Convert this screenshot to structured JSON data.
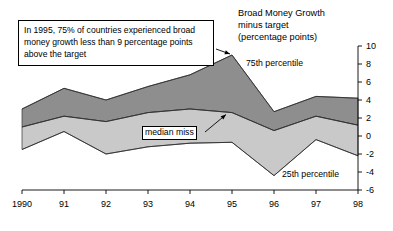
{
  "chart_data": {
    "type": "area",
    "title": "Broad Money Growth\nminus target\n(percentage points)",
    "xlabel": "",
    "ylabel": "",
    "x": [
      1990,
      1991,
      1992,
      1993,
      1994,
      1995,
      1996,
      1997,
      1998
    ],
    "categories": [
      "1990",
      "91",
      "92",
      "93",
      "94",
      "95",
      "96",
      "97",
      "98"
    ],
    "xlim": [
      1990,
      1998
    ],
    "ylim": [
      -6,
      10
    ],
    "ytick_values": [
      10,
      8,
      6,
      4,
      2,
      0,
      -2,
      -4,
      -6
    ],
    "ytick_labels": [
      "10",
      "8",
      "6",
      "4",
      "2",
      "0",
      "-2",
      "-4",
      "-6"
    ],
    "grid": false,
    "legend_position": "inline-annotations",
    "series": [
      {
        "name": "75th percentile",
        "values": [
          3.0,
          5.3,
          4.0,
          5.5,
          6.8,
          9.0,
          2.7,
          4.4,
          4.2
        ],
        "color": "#8c8c8c"
      },
      {
        "name": "median miss",
        "values": [
          1.0,
          2.2,
          1.6,
          2.6,
          3.0,
          2.6,
          0.6,
          2.2,
          1.2
        ],
        "color": "#c6c6c6"
      },
      {
        "name": "25th percentile",
        "values": [
          -1.5,
          0.5,
          -2.0,
          -1.2,
          -0.8,
          -0.7,
          -4.4,
          -0.4,
          -2.2
        ],
        "color": "#ffffff"
      }
    ],
    "annotations": [
      {
        "name": "callout-1995",
        "text": "In 1995, 75% of countries experienced broad money growth less than 9 percentage points above the target",
        "points_to": {
          "x": 1995,
          "y": 9.0
        }
      },
      {
        "name": "median-miss-callout",
        "text": "median miss",
        "points_to": {
          "x": 1995,
          "y": 2.6
        }
      }
    ]
  },
  "labels": {
    "p75": "75th percentile",
    "p25": "25th percentile",
    "median": "median miss"
  }
}
